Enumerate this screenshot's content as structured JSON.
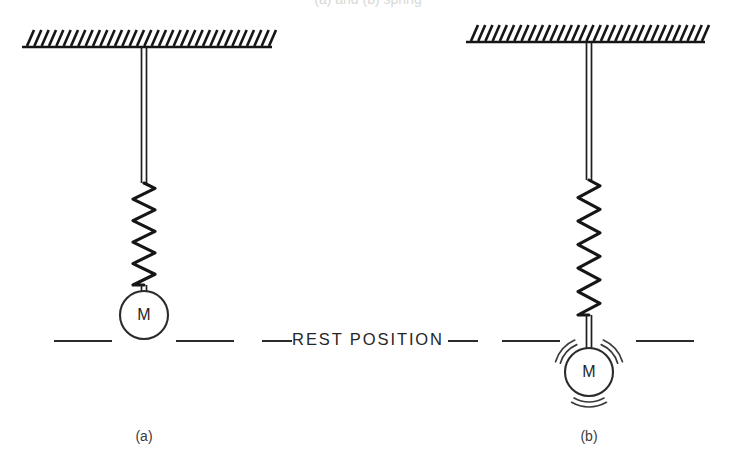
{
  "figure": {
    "title_clipped": "(a) and (b) spring",
    "background_color": "#ffffff",
    "ink_color": "#1f1f1f",
    "width": 736,
    "height": 470
  },
  "rest_line": {
    "label": "REST POSITION",
    "y": 341,
    "label_center_x": 368,
    "dashes": [
      {
        "x1": 54,
        "x2": 112
      },
      {
        "x1": 176,
        "x2": 234
      },
      {
        "x1": 262,
        "x2": 292
      },
      {
        "x1": 448,
        "x2": 478
      },
      {
        "x1": 502,
        "x2": 560
      },
      {
        "x1": 636,
        "x2": 694
      }
    ]
  },
  "panels": [
    {
      "id": "panel-a",
      "label": "(a)",
      "label_x": 144,
      "label_y": 437,
      "state": "at rest",
      "ceiling": {
        "x1": 22,
        "x2": 272,
        "y": 47,
        "hatch_count": 34,
        "hatch_length": 17,
        "hatch_slant": 7
      },
      "rod": {
        "x": 144,
        "y_top": 47,
        "y_bottom": 183,
        "width": 5
      },
      "spring": {
        "center_x": 144,
        "y_top": 183,
        "y_bottom": 285,
        "coils": 9,
        "amplitude": 11
      },
      "mass": {
        "label": "M",
        "cx": 144,
        "cy": 315,
        "r": 24,
        "neck_top": 285,
        "motion_arcs": 0
      }
    },
    {
      "id": "panel-b",
      "label": "(b)",
      "label_x": 589,
      "label_y": 437,
      "state": "stretched and oscillating",
      "ceiling": {
        "x1": 466,
        "x2": 705,
        "y": 42,
        "hatch_count": 33,
        "hatch_length": 17,
        "hatch_slant": 7
      },
      "rod": {
        "x": 589,
        "y_top": 42,
        "y_bottom": 180,
        "width": 5
      },
      "spring": {
        "center_x": 589,
        "y_top": 180,
        "y_bottom": 315,
        "coils": 11,
        "amplitude": 11
      },
      "mass": {
        "label": "M",
        "cx": 589,
        "cy": 372,
        "r": 24,
        "neck_top": 315,
        "motion_arcs": 6
      }
    }
  ]
}
